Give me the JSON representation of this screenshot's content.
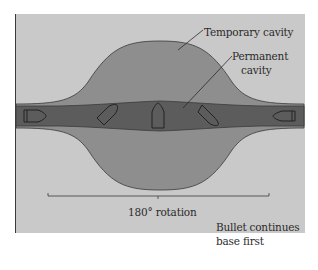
{
  "diagram": {
    "labels": {
      "temporary_cavity": "Temporary cavity",
      "permanent_cavity_line1": "Permanent",
      "permanent_cavity_line2": "cavity",
      "rotation": "180° rotation",
      "bullet_note_line1": "Bullet continues",
      "bullet_note_line2": "base first"
    },
    "colors": {
      "background": "#c9c9c9",
      "temporary_cavity": "#8e8e8e",
      "permanent_cavity": "#5c5c5c",
      "outline": "#3a3a3a"
    },
    "bullets": [
      {
        "position": "entry",
        "orientation": "point-forward"
      },
      {
        "position": "yawing",
        "orientation": "tilted"
      },
      {
        "position": "sideways",
        "orientation": "perpendicular"
      },
      {
        "position": "yawing",
        "orientation": "tilted-reverse"
      },
      {
        "position": "exit",
        "orientation": "base-forward"
      }
    ]
  }
}
